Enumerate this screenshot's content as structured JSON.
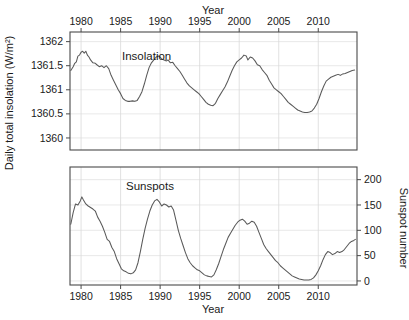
{
  "chart_data": [
    {
      "type": "line",
      "panel": "top",
      "title": "Insolation",
      "xlabel": "Year",
      "ylabel": "Daily total insolation (W/m²)",
      "xlim": [
        1978.6,
        2014.9
      ],
      "ylim": [
        1359.75,
        1362.2
      ],
      "xticks": [
        1980,
        1985,
        1990,
        1995,
        2000,
        2005,
        2010,
        2015
      ],
      "xticklabels": [
        "1980",
        "1985",
        "1990",
        "1995",
        "2000",
        "2005",
        "2010",
        "2015"
      ],
      "yticks": [
        1360,
        1360.5,
        1361,
        1361.5,
        1362
      ],
      "yticklabels": [
        "1360",
        "1360.5",
        "1361",
        "1361.5",
        "1362"
      ],
      "grid": true,
      "legend_position": "inside-top-left",
      "series": [
        {
          "name": "Insolation",
          "units": "W/m^2",
          "x": [
            1978.7,
            1979.0,
            1979.2,
            1979.4,
            1979.6,
            1979.8,
            1980.0,
            1980.2,
            1980.4,
            1980.6,
            1980.8,
            1981.0,
            1981.2,
            1981.5,
            1981.8,
            1982.0,
            1982.3,
            1982.6,
            1982.9,
            1983.2,
            1983.5,
            1983.8,
            1984.1,
            1984.4,
            1984.7,
            1985.0,
            1985.3,
            1985.6,
            1985.9,
            1986.2,
            1986.5,
            1986.8,
            1987.1,
            1987.4,
            1987.7,
            1988.0,
            1988.3,
            1988.6,
            1988.9,
            1989.2,
            1989.5,
            1989.8,
            1990.0,
            1990.2,
            1990.5,
            1990.8,
            1991.0,
            1991.3,
            1991.6,
            1991.9,
            1992.2,
            1992.5,
            1992.8,
            1993.1,
            1993.4,
            1993.7,
            1994.0,
            1994.3,
            1994.6,
            1994.9,
            1995.2,
            1995.5,
            1995.8,
            1996.1,
            1996.4,
            1996.7,
            1997.0,
            1997.3,
            1997.6,
            1997.9,
            1998.2,
            1998.5,
            1998.8,
            1999.1,
            1999.4,
            1999.7,
            2000.0,
            2000.3,
            2000.6,
            2000.9,
            2001.1,
            2001.4,
            2001.7,
            2002.0,
            2002.3,
            2002.6,
            2002.9,
            2003.2,
            2003.5,
            2003.8,
            2004.1,
            2004.4,
            2004.7,
            2005.0,
            2005.3,
            2005.6,
            2005.9,
            2006.2,
            2006.5,
            2006.8,
            2007.1,
            2007.4,
            2007.7,
            2008.0,
            2008.3,
            2008.6,
            2008.9,
            2009.2,
            2009.5,
            2009.8,
            2010.1,
            2010.4,
            2010.7,
            2011.0,
            2011.3,
            2011.6,
            2011.9,
            2012.2,
            2012.5,
            2012.8,
            2013.1,
            2013.4,
            2013.7,
            2014.0,
            2014.3,
            2014.6
          ],
          "y": [
            1361.4,
            1361.48,
            1361.55,
            1361.58,
            1361.7,
            1361.72,
            1361.78,
            1361.8,
            1361.76,
            1361.8,
            1361.72,
            1361.68,
            1361.62,
            1361.56,
            1361.55,
            1361.52,
            1361.48,
            1361.5,
            1361.46,
            1361.5,
            1361.44,
            1361.3,
            1361.2,
            1361.1,
            1361.0,
            1360.92,
            1360.82,
            1360.78,
            1360.76,
            1360.76,
            1360.77,
            1360.76,
            1360.78,
            1360.86,
            1360.96,
            1361.12,
            1361.3,
            1361.46,
            1361.56,
            1361.62,
            1361.68,
            1361.7,
            1361.68,
            1361.64,
            1361.62,
            1361.6,
            1361.62,
            1361.56,
            1361.57,
            1361.5,
            1361.44,
            1361.38,
            1361.3,
            1361.22,
            1361.14,
            1361.08,
            1361.04,
            1361.0,
            1360.96,
            1360.92,
            1360.86,
            1360.8,
            1360.74,
            1360.7,
            1360.68,
            1360.67,
            1360.72,
            1360.82,
            1360.9,
            1360.98,
            1361.06,
            1361.16,
            1361.28,
            1361.4,
            1361.5,
            1361.58,
            1361.62,
            1361.66,
            1361.72,
            1361.7,
            1361.62,
            1361.68,
            1361.66,
            1361.6,
            1361.52,
            1361.5,
            1361.42,
            1361.36,
            1361.3,
            1361.2,
            1361.12,
            1361.04,
            1361.0,
            1360.96,
            1360.92,
            1360.86,
            1360.8,
            1360.74,
            1360.7,
            1360.66,
            1360.62,
            1360.58,
            1360.56,
            1360.54,
            1360.53,
            1360.53,
            1360.54,
            1360.56,
            1360.62,
            1360.7,
            1360.82,
            1360.96,
            1361.08,
            1361.18,
            1361.22,
            1361.26,
            1361.28,
            1361.3,
            1361.32,
            1361.3,
            1361.33,
            1361.34,
            1361.36,
            1361.38,
            1361.4,
            1361.41
          ]
        }
      ]
    },
    {
      "type": "line",
      "panel": "bottom",
      "title": "Sunspots",
      "xlabel": "Year",
      "ylabel": "Sunspot number",
      "xlim": [
        1978.6,
        2014.9
      ],
      "ylim": [
        -8,
        225
      ],
      "xticks": [
        1980,
        1985,
        1990,
        1995,
        2000,
        2005,
        2010,
        2015
      ],
      "xticklabels": [
        "1980",
        "1985",
        "1990",
        "1995",
        "2000",
        "2005",
        "2010",
        "2015"
      ],
      "yticks": [
        0,
        50,
        100,
        150,
        200
      ],
      "yticklabels": [
        "0",
        "50",
        "100",
        "150",
        "200"
      ],
      "grid": true,
      "legend_position": "inside-top-left",
      "series": [
        {
          "name": "Sunspots",
          "units": "count",
          "x": [
            1978.7,
            1979.0,
            1979.3,
            1979.6,
            1979.9,
            1980.1,
            1980.3,
            1980.6,
            1980.9,
            1981.2,
            1981.5,
            1981.8,
            1982.1,
            1982.4,
            1982.7,
            1983.0,
            1983.3,
            1983.6,
            1983.9,
            1984.2,
            1984.5,
            1984.8,
            1985.1,
            1985.4,
            1985.7,
            1986.0,
            1986.3,
            1986.6,
            1986.9,
            1987.2,
            1987.5,
            1987.8,
            1988.1,
            1988.4,
            1988.7,
            1989.0,
            1989.3,
            1989.6,
            1989.9,
            1990.2,
            1990.5,
            1990.8,
            1991.1,
            1991.4,
            1991.7,
            1992.0,
            1992.3,
            1992.6,
            1992.9,
            1993.2,
            1993.5,
            1993.8,
            1994.1,
            1994.4,
            1994.7,
            1995.0,
            1995.3,
            1995.6,
            1995.9,
            1996.2,
            1996.5,
            1996.8,
            1997.1,
            1997.4,
            1997.7,
            1998.0,
            1998.3,
            1998.6,
            1998.9,
            1999.2,
            1999.5,
            1999.8,
            2000.1,
            2000.4,
            2000.7,
            2001.0,
            2001.3,
            2001.6,
            2001.9,
            2002.2,
            2002.5,
            2002.8,
            2003.1,
            2003.4,
            2003.7,
            2004.0,
            2004.3,
            2004.6,
            2004.9,
            2005.2,
            2005.5,
            2005.8,
            2006.1,
            2006.4,
            2006.7,
            2007.0,
            2007.3,
            2007.6,
            2007.9,
            2008.2,
            2008.5,
            2008.8,
            2009.1,
            2009.4,
            2009.7,
            2010.0,
            2010.3,
            2010.6,
            2010.9,
            2011.2,
            2011.5,
            2011.8,
            2012.1,
            2012.4,
            2012.7,
            2013.0,
            2013.3,
            2013.6,
            2013.9,
            2014.2,
            2014.5,
            2014.7
          ],
          "y": [
            112,
            135,
            152,
            150,
            158,
            166,
            160,
            152,
            148,
            145,
            142,
            138,
            126,
            118,
            108,
            96,
            82,
            78,
            66,
            58,
            44,
            34,
            24,
            20,
            18,
            15,
            14,
            16,
            22,
            36,
            58,
            82,
            104,
            122,
            138,
            150,
            158,
            161,
            156,
            148,
            152,
            150,
            146,
            148,
            140,
            120,
            100,
            84,
            70,
            56,
            44,
            36,
            30,
            26,
            22,
            20,
            16,
            12,
            10,
            9,
            8,
            12,
            22,
            34,
            48,
            62,
            74,
            86,
            94,
            102,
            110,
            116,
            120,
            122,
            118,
            112,
            114,
            118,
            116,
            108,
            96,
            84,
            72,
            64,
            58,
            52,
            46,
            40,
            36,
            30,
            26,
            22,
            18,
            14,
            10,
            8,
            6,
            4,
            3,
            2,
            2,
            2,
            3,
            6,
            12,
            20,
            30,
            42,
            52,
            58,
            56,
            52,
            54,
            58,
            56,
            58,
            62,
            68,
            74,
            78,
            80,
            82
          ]
        }
      ]
    }
  ],
  "axes": {
    "top_x_title": "Year",
    "bottom_x_title": "Year",
    "left_y_title": "Daily total insolation (W/m²)",
    "right_y_title": "Sunspot number"
  },
  "labels": {
    "insolation": "Insolation",
    "sunspots": "Sunspots"
  },
  "colors": {
    "line": "#595959",
    "frame": "#4a4a4a",
    "grid": "#e2e2e2",
    "background": "#ffffff",
    "text": "#1a1a1a"
  }
}
